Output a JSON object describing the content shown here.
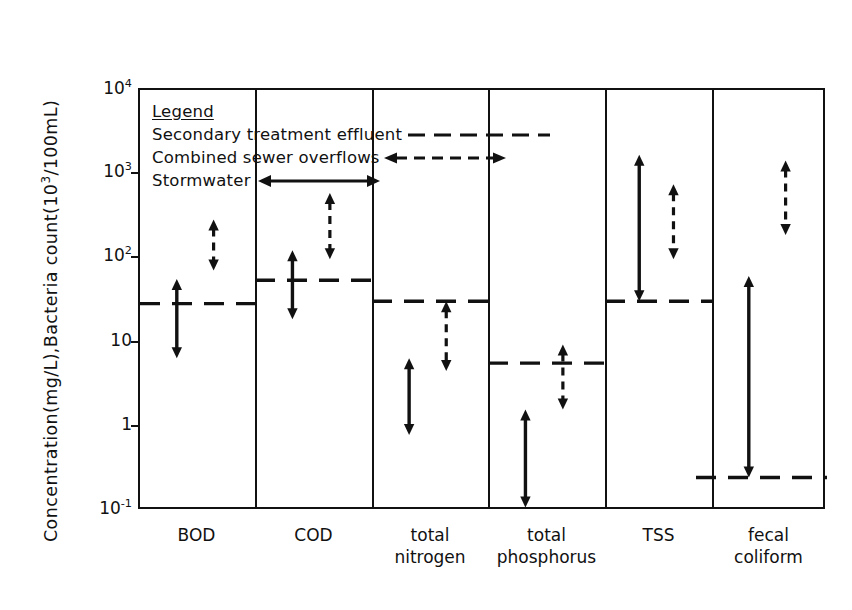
{
  "chart_data": {
    "type": "range",
    "title": "",
    "xlabel": "",
    "ylabel_parts": {
      "pre": "Concentration(mg/L),Bacteria count(10",
      "sup": "3",
      "post": "/100mL)"
    },
    "ylabel": "Concentration(mg/L),Bacteria count(10^3/100mL)",
    "yscale": "log",
    "ylim": [
      0.1,
      10000
    ],
    "yticks": [
      {
        "value": 10000,
        "label_mantissa": "10",
        "label_exp": "4"
      },
      {
        "value": 1000,
        "label_mantissa": "10",
        "label_exp": "3"
      },
      {
        "value": 100,
        "label_mantissa": "10",
        "label_exp": "2"
      },
      {
        "value": 10,
        "label_mantissa": "10",
        "label_exp": ""
      },
      {
        "value": 1,
        "label_mantissa": "1",
        "label_exp": ""
      },
      {
        "value": 0.1,
        "label_mantissa": "10",
        "label_exp": "-1"
      }
    ],
    "grid": false,
    "legend_position": "top-left-inside",
    "legend": {
      "title": "Legend",
      "entries": [
        {
          "name": "Secondary treatment effluent",
          "style": "dashed-line",
          "arrows": "none"
        },
        {
          "name": "Combined sewer overflows",
          "style": "dashed-arrow",
          "arrows": "both"
        },
        {
          "name": "Stormwater",
          "style": "solid-arrow",
          "arrows": "both"
        }
      ]
    },
    "categories": [
      {
        "label_line1": "BOD",
        "label_line2": ""
      },
      {
        "label_line1": "COD",
        "label_line2": ""
      },
      {
        "label_line1": "total",
        "label_line2": "nitrogen"
      },
      {
        "label_line1": "total",
        "label_line2": "phosphorus"
      },
      {
        "label_line1": "TSS",
        "label_line2": ""
      },
      {
        "label_line1": "fecal",
        "label_line2": "coliform"
      }
    ],
    "series": [
      {
        "name": "Stormwater",
        "style": "solid-arrow",
        "values": [
          {
            "category": "BOD",
            "low": 6.5,
            "high": 57
          },
          {
            "category": "COD",
            "low": 19,
            "high": 125
          },
          {
            "category": "total nitrogen",
            "low": 0.8,
            "high": 6.5
          },
          {
            "category": "total phosphorus",
            "low": 0.11,
            "high": 1.6
          },
          {
            "category": "TSS",
            "low": 31,
            "high": 1700
          },
          {
            "category": "fecal coliform",
            "low": 0.25,
            "high": 62
          }
        ]
      },
      {
        "name": "Combined sewer overflows",
        "style": "dashed-arrow",
        "values": [
          {
            "category": "BOD",
            "low": 72,
            "high": 290
          },
          {
            "category": "COD",
            "low": 98,
            "high": 600
          },
          {
            "category": "total nitrogen",
            "low": 4.6,
            "high": 31
          },
          {
            "category": "total phosphorus",
            "low": 1.6,
            "high": 9.5
          },
          {
            "category": "TSS",
            "low": 98,
            "high": 760
          },
          {
            "category": "fecal coliform",
            "low": 190,
            "high": 1450
          }
        ]
      },
      {
        "name": "Secondary treatment effluent",
        "style": "dashed-line",
        "values": [
          {
            "category": "BOD",
            "level": 29
          },
          {
            "category": "COD",
            "level": 55
          },
          {
            "category": "total nitrogen",
            "level": 31
          },
          {
            "category": "total phosphorus",
            "level": 5.7
          },
          {
            "category": "TSS",
            "level": 31
          },
          {
            "category": "fecal coliform",
            "level": 0.25
          }
        ]
      }
    ]
  },
  "colors": {
    "ink": "#111111",
    "background": "#ffffff"
  }
}
